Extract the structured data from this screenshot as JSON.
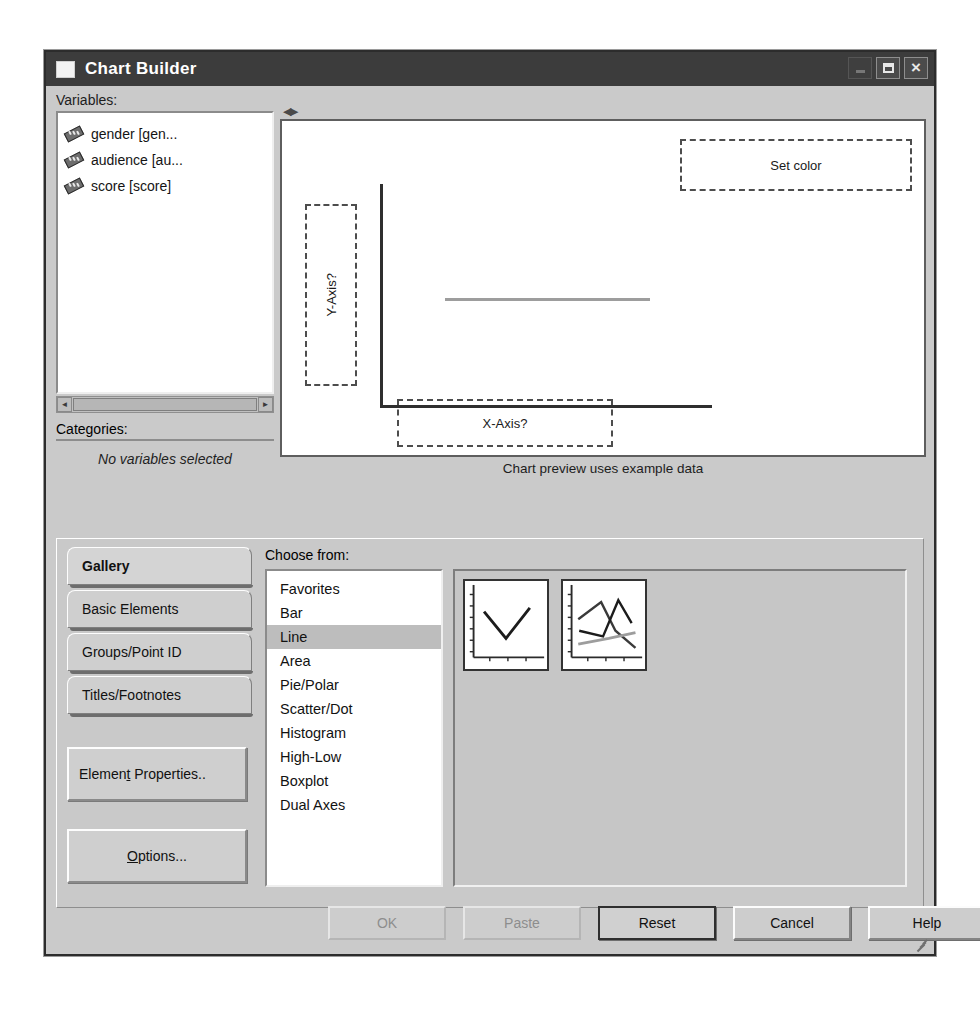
{
  "window": {
    "title": "Chart Builder",
    "app_icon": "app-icon",
    "minimize_label": "",
    "maximize_label": "",
    "close_label": "×"
  },
  "variables_panel": {
    "label": "Variables:",
    "items": [
      {
        "name": "gender [gen...",
        "icon": "ruler-icon"
      },
      {
        "name": "audience [au...",
        "icon": "ruler-icon"
      },
      {
        "name": "score [score]",
        "icon": "ruler-icon"
      }
    ],
    "scroll_left_arrow": "◄",
    "scroll_right_arrow": "►"
  },
  "categories_panel": {
    "label": "Categories:",
    "empty_text": "No variables selected"
  },
  "splitter": {
    "arrows": "◀▶"
  },
  "canvas": {
    "caption": "Chart preview uses example data",
    "dropzones": {
      "color": "Set color",
      "x_axis": "X-Axis?",
      "y_axis": "Y-Axis?"
    }
  },
  "tabs": [
    {
      "label": "Gallery",
      "active": true
    },
    {
      "label": "Basic Elements",
      "active": false
    },
    {
      "label": "Groups/Point ID",
      "active": false
    },
    {
      "label": "Titles/Footnotes",
      "active": false
    }
  ],
  "side_buttons": {
    "element_properties": "Element Properties..",
    "options": "Options..."
  },
  "gallery": {
    "choose_label": "Choose from:",
    "items": [
      {
        "label": "Favorites",
        "selected": false
      },
      {
        "label": "Bar",
        "selected": false
      },
      {
        "label": "Line",
        "selected": true
      },
      {
        "label": "Area",
        "selected": false
      },
      {
        "label": "Pie/Polar",
        "selected": false
      },
      {
        "label": "Scatter/Dot",
        "selected": false
      },
      {
        "label": "Histogram",
        "selected": false
      },
      {
        "label": "High-Low",
        "selected": false
      },
      {
        "label": "Boxplot",
        "selected": false
      },
      {
        "label": "Dual Axes",
        "selected": false
      }
    ],
    "thumbnails": [
      {
        "name": "simple-line-chart"
      },
      {
        "name": "multiple-line-chart"
      }
    ]
  },
  "footer_buttons": [
    {
      "label": "OK",
      "enabled": false,
      "default": false
    },
    {
      "label": "Paste",
      "enabled": false,
      "default": false
    },
    {
      "label": "Reset",
      "enabled": true,
      "default": true
    },
    {
      "label": "Cancel",
      "enabled": true,
      "default": false
    },
    {
      "label": "Help",
      "enabled": true,
      "default": false
    }
  ],
  "chart_data": {
    "type": "line",
    "title": "Chart preview uses example data",
    "xlabel": "X-Axis?",
    "ylabel": "Y-Axis?",
    "series": [
      {
        "name": "preview-line",
        "x": [
          0,
          1
        ],
        "values": [
          0.5,
          0.5
        ]
      }
    ],
    "grid": false,
    "legend": "none",
    "annotations": [
      "Set color"
    ]
  }
}
